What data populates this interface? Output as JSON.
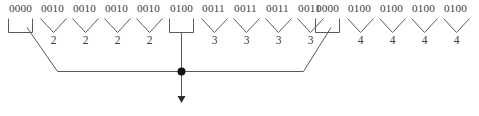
{
  "diagram": {
    "stroke_color": "#5a5a5a",
    "text_color": "#3c3c3c",
    "background": "#ffffff",
    "groups": [
      {
        "code": "0000",
        "symbol": "",
        "connector": "bracket-diagonal-left"
      },
      {
        "code": "0010",
        "symbol": "2",
        "connector": "vee"
      },
      {
        "code": "0010",
        "symbol": "2",
        "connector": "vee"
      },
      {
        "code": "0010",
        "symbol": "2",
        "connector": "vee"
      },
      {
        "code": "0010",
        "symbol": "2",
        "connector": "vee"
      },
      {
        "code": "0100",
        "symbol": "",
        "connector": "bracket-stem"
      },
      {
        "code": "0011",
        "symbol": "3",
        "connector": "vee"
      },
      {
        "code": "0011",
        "symbol": "3",
        "connector": "vee"
      },
      {
        "code": "0011",
        "symbol": "3",
        "connector": "vee"
      },
      {
        "code": "0011",
        "symbol": "3",
        "connector": "vee"
      },
      {
        "code": "0000",
        "symbol": "",
        "connector": "bracket-diagonal-right"
      },
      {
        "code": "0100",
        "symbol": "4",
        "connector": "vee"
      },
      {
        "code": "0100",
        "symbol": "4",
        "connector": "vee"
      },
      {
        "code": "0100",
        "symbol": "4",
        "connector": "vee"
      },
      {
        "code": "0100",
        "symbol": "4",
        "connector": "vee"
      }
    ],
    "junction": {
      "x": 181,
      "y": 72
    },
    "arrow": {
      "from_y": 72,
      "to_y": 103,
      "x": 181,
      "direction": "down"
    },
    "caption": ""
  }
}
